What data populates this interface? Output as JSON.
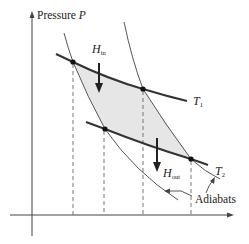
{
  "diagram": {
    "axes": {
      "y_label_text": "Pressure ",
      "y_label_symbol": "P",
      "x_label": ""
    },
    "isotherms": [
      {
        "symbol": "T",
        "subscript": "1",
        "role": "hot isotherm"
      },
      {
        "symbol": "T",
        "subscript": "2",
        "role": "cold isotherm"
      }
    ],
    "heat_flows": [
      {
        "symbol": "H",
        "subscript": "in",
        "direction": "down"
      },
      {
        "symbol": "H",
        "subscript": "out",
        "direction": "down"
      }
    ],
    "adiabats_label": "Adiabats",
    "cycle_corners": 4,
    "shaded_region": "enclosed cycle area (work)",
    "colors": {
      "line": "#333333",
      "thin_line": "#555555",
      "fill": "#e6e6e6",
      "background": "#ffffff"
    }
  }
}
